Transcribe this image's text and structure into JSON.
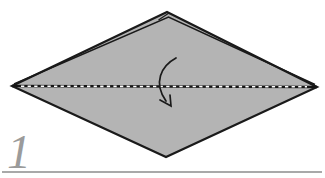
{
  "diagram": {
    "step_number": "1",
    "fold_line_style": "dashed",
    "arrow_direction": "down",
    "colors": {
      "background": "#ffffff",
      "paper_fill": "#b4b4b4",
      "outline": "#1a1a1a",
      "fold_line": "#141414",
      "fold_dash": "#ffffff",
      "arrow": "#1a1a1a",
      "step_number": "#9b9b9b",
      "step_rule": "#a9a9a9"
    }
  }
}
